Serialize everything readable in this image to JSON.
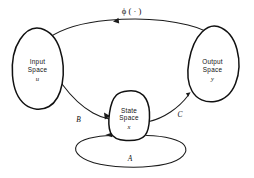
{
  "diagram": {
    "background_color": "#ffffff",
    "ink_color": "#111111",
    "nodes": [
      {
        "id": "input-space",
        "line1": "Input",
        "line2": "Space",
        "symbol": "u"
      },
      {
        "id": "state-space",
        "line1": "State",
        "line2": "Space",
        "symbol": "x"
      },
      {
        "id": "output-space",
        "line1": "Output",
        "line2": "Space",
        "symbol": "y"
      }
    ],
    "edges": [
      {
        "id": "phi-map",
        "label": "ϕ ( · )",
        "from": "input-space",
        "to": "output-space"
      },
      {
        "id": "b-map",
        "label": "B",
        "from": "input-space",
        "to": "state-space"
      },
      {
        "id": "c-map",
        "label": "C",
        "from": "state-space",
        "to": "output-space"
      },
      {
        "id": "a-map",
        "label": "A",
        "from": "state-space",
        "to": "state-space"
      }
    ]
  }
}
